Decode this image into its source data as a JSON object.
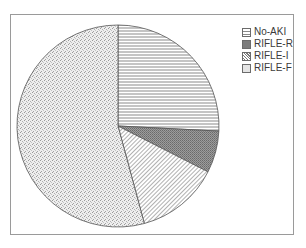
{
  "chart_data": {
    "type": "pie",
    "title": "",
    "categories": [
      "No-AKI",
      "RIFLE-R",
      "RIFLE-I",
      "RIFLE-F"
    ],
    "values": [
      25.8,
      6.7,
      13.3,
      54.2
    ],
    "units": "percent (estimated from slice angles)",
    "start_angle": "12 o'clock, clockwise",
    "legend": {
      "position": "upper-right",
      "entries": [
        {
          "label": "No-AKI",
          "pattern": "horizontal-lines"
        },
        {
          "label": "RIFLE-R",
          "pattern": "dense-dark-grid"
        },
        {
          "label": "RIFLE-I",
          "pattern": "diagonal-hatch"
        },
        {
          "label": "RIFLE-F",
          "pattern": "fine-dots"
        }
      ]
    }
  },
  "legend": {
    "items": [
      {
        "label": "No-AKI"
      },
      {
        "label": "RIFLE-R"
      },
      {
        "label": "RIFLE-I"
      },
      {
        "label": "RIFLE-F"
      }
    ]
  },
  "colors": {
    "outline": "#555555",
    "frame": "#9a9a9a",
    "pattern_ink": "#6e6e6e"
  }
}
